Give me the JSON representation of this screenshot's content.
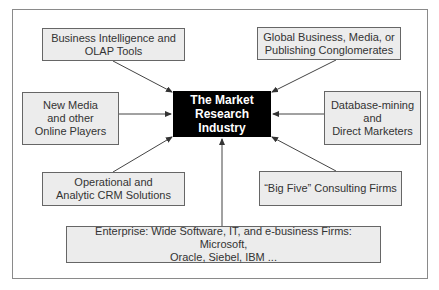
{
  "caption": "Figure: The Market Research Industry",
  "center": {
    "label": "The Market\nResearch\nIndustry"
  },
  "nodes": {
    "bi": {
      "label": "Business Intelligence and\nOLAP Tools"
    },
    "global": {
      "label": "Global Business, Media, or\nPublishing Conglomerates"
    },
    "new_media": {
      "label": "New Media\nand other\nOnline Players"
    },
    "database": {
      "label": "Database-mining\nand\nDirect Marketers"
    },
    "crm": {
      "label": "Operational and\nAnalytic CRM Solutions"
    },
    "big_five": {
      "label": "“Big Five” Consulting Firms"
    },
    "enterprise": {
      "label": "Enterprise: Wide Software, IT, and e-business Firms: Microsoft,\nOracle, Siebel, IBM ..."
    }
  },
  "colors": {
    "center_bg": "#000000",
    "node_bg": "#ececec",
    "border": "#666666",
    "arrow": "#333333"
  }
}
